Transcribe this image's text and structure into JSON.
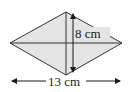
{
  "diagram": {
    "shape": "rhombus",
    "fill_color": "#e4e4e4",
    "stroke_color": "#333333",
    "vertical_diagonal": {
      "label": "8 cm",
      "value": 8,
      "unit": "cm"
    },
    "horizontal_diagonal": {
      "label": "13 cm",
      "value": 13,
      "unit": "cm"
    }
  }
}
